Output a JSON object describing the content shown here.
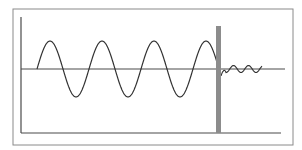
{
  "diagram": {
    "title": "",
    "colors": {
      "frame": "#8a8a8a",
      "axis": "#4a4a4a",
      "wave": "#333333",
      "barrier": "#8c8c8c",
      "background": "#ffffff"
    },
    "frame": {
      "x": 13,
      "y": 9,
      "width": 280,
      "height": 136
    },
    "axes": {
      "y_axis": {
        "x": 21,
        "y1": 17,
        "y2": 133
      },
      "x_axis": {
        "y": 133,
        "x1": 21,
        "x2": 281
      },
      "midline": {
        "y": 69,
        "x1": 21,
        "x2": 285
      }
    },
    "barrier": {
      "x": 216,
      "y": 26,
      "width": 5,
      "height": 107
    },
    "wave": {
      "start_x": 37,
      "midline_y": 69,
      "amplitude": 28,
      "period": 52,
      "end_x": 221
    },
    "damped_wave": {
      "start_x": 221,
      "end_x": 262,
      "amplitude": 3.5,
      "period": 15
    }
  }
}
